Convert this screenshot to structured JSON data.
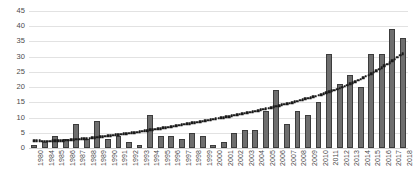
{
  "chart_data": {
    "type": "bar",
    "title": "",
    "subtitle": "",
    "xlabel": "",
    "ylabel": "",
    "ylim": [
      0,
      45
    ],
    "ytick_step": 5,
    "yticks": [
      45,
      40,
      35,
      30,
      25,
      20,
      15,
      10,
      5,
      0
    ],
    "grid": true,
    "legend": null,
    "legend_position": "none",
    "categories": [
      "1980",
      "1984",
      "1985",
      "1986",
      "1987",
      "1988",
      "1989",
      "1990",
      "1991",
      "1992",
      "1993",
      "1994",
      "1995",
      "1996",
      "1997",
      "1998",
      "1999",
      "2000",
      "2001",
      "2002",
      "2003",
      "2004",
      "2005",
      "2006",
      "2007",
      "2008",
      "2009",
      "2010",
      "2011",
      "2012",
      "2013",
      "2014",
      "2015",
      "2016",
      "2017",
      "2018"
    ],
    "values": [
      1,
      2,
      4,
      3,
      8,
      3,
      9,
      3,
      4,
      2,
      1,
      11,
      4,
      4,
      3,
      5,
      4,
      1,
      2,
      5,
      6,
      6,
      12,
      19,
      8,
      12,
      11,
      15,
      31,
      21,
      24,
      20,
      31,
      31,
      39,
      36
    ],
    "series": [
      {
        "name": "Count",
        "type": "bar",
        "values": [
          1,
          2,
          4,
          3,
          8,
          3,
          9,
          3,
          4,
          2,
          1,
          11,
          4,
          4,
          3,
          5,
          4,
          1,
          2,
          5,
          6,
          6,
          12,
          19,
          8,
          12,
          11,
          15,
          31,
          21,
          24,
          20,
          31,
          31,
          39,
          36
        ],
        "color": "#6e6e6e",
        "edge_color": "#3c3c3c"
      },
      {
        "name": "Trendline",
        "type": "line",
        "style": "dotted",
        "color": "#1a1a1a",
        "values": [
          2.4,
          2.2,
          2.3,
          2.5,
          2.8,
          3.1,
          3.5,
          4.0,
          4.4,
          4.8,
          5.3,
          5.9,
          6.4,
          7.0,
          7.6,
          8.2,
          8.8,
          9.4,
          10.0,
          10.7,
          11.4,
          12.1,
          12.9,
          13.7,
          14.5,
          15.4,
          16.3,
          17.3,
          18.4,
          19.6,
          21.0,
          22.6,
          24.4,
          26.4,
          28.6,
          31.0
        ]
      }
    ]
  },
  "axis": {
    "y_tick_labels": [
      "45",
      "40",
      "35",
      "30",
      "25",
      "20",
      "15",
      "10",
      "5",
      "0"
    ]
  }
}
